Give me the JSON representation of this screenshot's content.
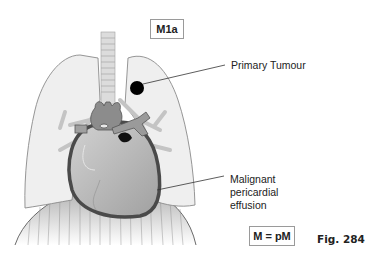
{
  "stage_label": "M1a",
  "callouts": {
    "primary_tumour": "Primary Tumour",
    "effusion_line1": "Malignant",
    "effusion_line2": "pericardial",
    "effusion_line3": "effusion"
  },
  "equation_label": "M = pM",
  "figure_number": "Fig. 284",
  "colors": {
    "lung_fill": "#efefef",
    "lung_stroke": "#8a8a8a",
    "heart_fill": "#b4b4b4",
    "pericardium_stroke": "#4a4a4a",
    "vessel_fill": "#8c8c8c",
    "tumour": "#000000",
    "diaphragm": "#c8c8c8"
  }
}
